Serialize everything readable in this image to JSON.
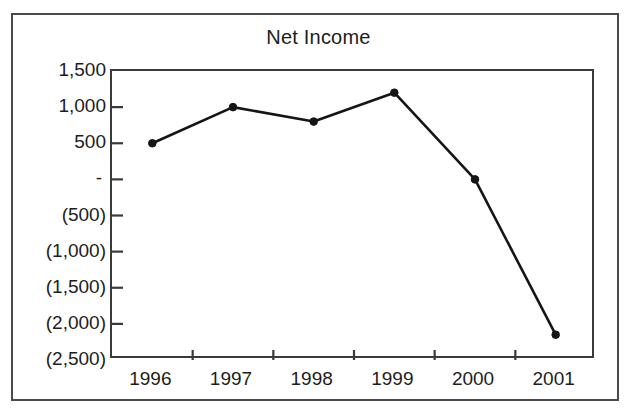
{
  "chart_data": {
    "type": "line",
    "title": "Net Income",
    "xlabel": "",
    "ylabel": "",
    "categories": [
      "1996",
      "1997",
      "1998",
      "1999",
      "2000",
      "2001"
    ],
    "values": [
      500,
      1000,
      800,
      1200,
      0,
      -2150
    ],
    "series": [
      {
        "name": "Net Income",
        "values": [
          500,
          1000,
          800,
          1200,
          0,
          -2150
        ]
      }
    ],
    "ylim": [
      -2500,
      1500
    ],
    "ytick_values": [
      1500,
      1000,
      500,
      0,
      -500,
      -1000,
      -1500,
      -2000,
      -2500
    ],
    "ytick_labels": [
      "1,500",
      "1,000",
      "500",
      "-",
      "(500)",
      "(1,000)",
      "(1,500)",
      "(2,000)",
      "(2,500)"
    ],
    "xtick_labels": [
      "1996",
      "1997",
      "1998",
      "1999",
      "2000",
      "2001"
    ],
    "grid": false,
    "legend": false,
    "legend_position": "none",
    "marker": "filled-circle",
    "line_color": "#151515",
    "marker_color": "#151515",
    "axis_color": "#3a3a3a",
    "frame_color": "#4a4a4a",
    "background_color": "#ffffff",
    "text_color": "#1d1d1d",
    "annotations": []
  },
  "frame": {
    "label": "scanned-figure-border"
  }
}
